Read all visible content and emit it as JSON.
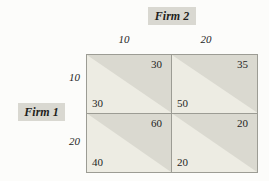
{
  "matrix": {
    "col_player": "Firm 2",
    "row_player": "Firm 1",
    "col_strategies": [
      "10",
      "20"
    ],
    "row_strategies": [
      "10",
      "20"
    ],
    "cells": [
      {
        "row": "10",
        "col": "10",
        "firm2_payoff": "30",
        "firm1_payoff": "30"
      },
      {
        "row": "10",
        "col": "20",
        "firm2_payoff": "35",
        "firm1_payoff": "50"
      },
      {
        "row": "20",
        "col": "10",
        "firm2_payoff": "60",
        "firm1_payoff": "40"
      },
      {
        "row": "20",
        "col": "20",
        "firm2_payoff": "20",
        "firm1_payoff": "20"
      }
    ]
  },
  "colors": {
    "cell_upper_triangle": "#dad9d0",
    "cell_lower_triangle": "#edece3",
    "player_label_background": "#d9d8d1",
    "grid_line": "#9c9c94",
    "text": "#1f1f1d",
    "page_background": "#fcfcfa"
  }
}
